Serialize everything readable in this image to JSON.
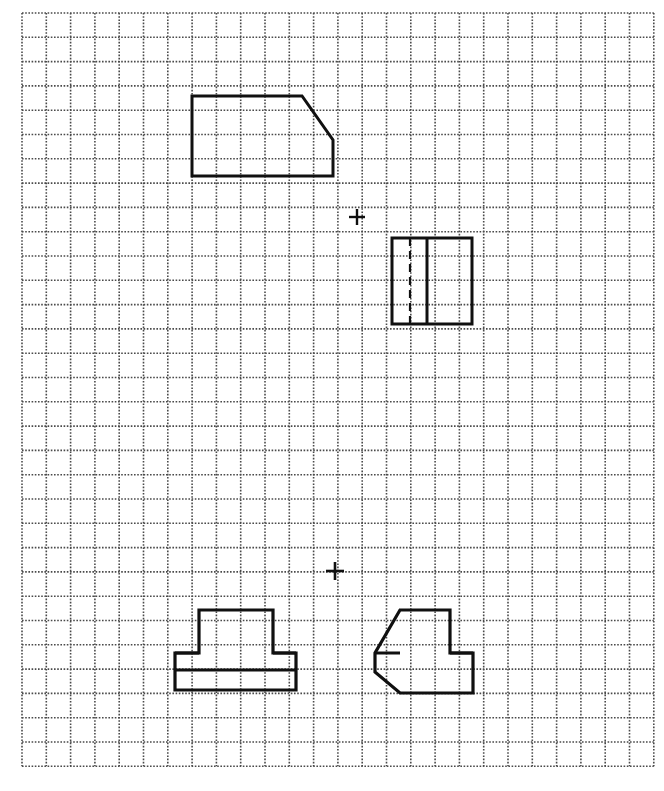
{
  "page": {
    "width": 664,
    "height": 791,
    "background_color": "#ffffff",
    "ink_color": "#101010",
    "grid_color": "#4a4a4a"
  },
  "grid": {
    "name": "dotted-square-grid",
    "style": "dotted",
    "spacing_px": 24.3,
    "origin_x": 22,
    "origin_y": 13,
    "columns": 26,
    "rows": 31,
    "dot_size_px": 1.6,
    "dot_period_px": 3.2,
    "color": "#4a4a4a",
    "description": "Light dotted square grid covering the whole sheet, used as sketch paper."
  },
  "views": [
    {
      "id": "top-view",
      "name": "top-view-plate-with-chamfer-and-arch-notch",
      "label": "Top view",
      "line_weight": 3.0,
      "line_style": "solid",
      "outline": [
        [
          192,
          96
        ],
        [
          302,
          96
        ],
        [
          333,
          140
        ],
        [
          333,
          176
        ],
        [
          281,
          176
        ],
        [
          248,
          176
        ],
        [
          192,
          176
        ]
      ],
      "closed": true,
      "features": [
        {
          "type": "arc-notch",
          "name": "semicircular-notch",
          "center": [
            264.5,
            176
          ],
          "radius": 16.5,
          "start": [
            248,
            176
          ],
          "end": [
            281,
            176
          ],
          "sweep": "upward",
          "description": "Semicircular arch cut into the bottom edge."
        },
        {
          "type": "chamfer",
          "name": "corner-chamfer",
          "start": [
            302,
            96
          ],
          "end": [
            333,
            140
          ],
          "description": "Angled cut at the upper right corner."
        }
      ]
    },
    {
      "id": "end-view",
      "name": "end-view-rectangle-with-hidden-line",
      "label": "End view",
      "line_weight": 3.0,
      "line_style": "solid",
      "outline": [
        [
          392,
          238
        ],
        [
          472,
          238
        ],
        [
          472,
          324
        ],
        [
          392,
          324
        ]
      ],
      "closed": true,
      "features": [
        {
          "type": "hidden-line",
          "name": "hidden-edge-dashed",
          "line_style": "dashed",
          "dash_pattern": "8 5",
          "line_weight": 2.2,
          "from": [
            410,
            238
          ],
          "to": [
            410,
            324
          ],
          "description": "Dashed hidden edge inside the rectangle."
        },
        {
          "type": "visible-line",
          "name": "visible-internal-edge",
          "line_style": "solid",
          "line_weight": 3.0,
          "from": [
            427,
            238
          ],
          "to": [
            427,
            324
          ],
          "description": "Solid internal division line."
        }
      ]
    },
    {
      "id": "front-view",
      "name": "front-view-stepped-block",
      "label": "Front view",
      "line_weight": 3.2,
      "line_style": "solid",
      "outline": [
        [
          199,
          610
        ],
        [
          273,
          610
        ],
        [
          273,
          653
        ],
        [
          296,
          653
        ],
        [
          296,
          690
        ],
        [
          175,
          690
        ],
        [
          175,
          653
        ],
        [
          199,
          653
        ]
      ],
      "closed": true,
      "features": [
        {
          "type": "visible-line",
          "name": "base-division-line",
          "line_style": "solid",
          "line_weight": 3.0,
          "from": [
            175,
            670
          ],
          "to": [
            296,
            670
          ],
          "description": "Horizontal line splitting the base into two bands."
        },
        {
          "type": "visible-line",
          "name": "upper-block-seat-line-left",
          "line_style": "solid",
          "line_weight": 3.0,
          "from": [
            175,
            653
          ],
          "to": [
            199,
            653
          ],
          "description": "Left shoulder of the base under the upper block."
        },
        {
          "type": "visible-line",
          "name": "upper-block-seat-line-right",
          "line_style": "solid",
          "line_weight": 3.0,
          "from": [
            273,
            653
          ],
          "to": [
            296,
            653
          ],
          "description": "Right shoulder of the base under the upper block."
        }
      ]
    },
    {
      "id": "side-view",
      "name": "side-view-block-with-chamfered-base",
      "label": "Side view",
      "line_weight": 3.2,
      "line_style": "solid",
      "outline": [
        [
          400,
          610
        ],
        [
          450,
          610
        ],
        [
          450,
          653
        ],
        [
          473,
          653
        ],
        [
          473,
          693
        ],
        [
          400,
          693
        ],
        [
          375,
          672
        ],
        [
          375,
          653
        ]
      ],
      "closed": true,
      "features": [
        {
          "type": "chamfer",
          "name": "base-chamfer",
          "start": [
            375,
            672
          ],
          "end": [
            400,
            693
          ],
          "description": "Angled cut at the lower left of the base."
        },
        {
          "type": "visible-line",
          "name": "upper-block-seat-line-left",
          "line_style": "solid",
          "line_weight": 3.0,
          "from": [
            375,
            653
          ],
          "to": [
            400,
            653
          ],
          "description": "Left shoulder of the base beside the upper block."
        },
        {
          "type": "visible-line",
          "name": "upper-block-seat-line-right",
          "line_style": "solid",
          "line_weight": 3.0,
          "from": [
            450,
            653
          ],
          "to": [
            473,
            653
          ],
          "description": "Right shoulder of the base beside the upper block."
        }
      ]
    }
  ],
  "markers": [
    {
      "id": "crosshair-upper",
      "name": "projection-crosshair-upper",
      "glyph": "+",
      "x": 357,
      "y": 217,
      "arm_length_px": 8,
      "line_weight": 2.4
    },
    {
      "id": "crosshair-lower",
      "name": "projection-crosshair-lower",
      "glyph": "+",
      "x": 335,
      "y": 571,
      "arm_length_px": 9,
      "line_weight": 2.6
    }
  ]
}
